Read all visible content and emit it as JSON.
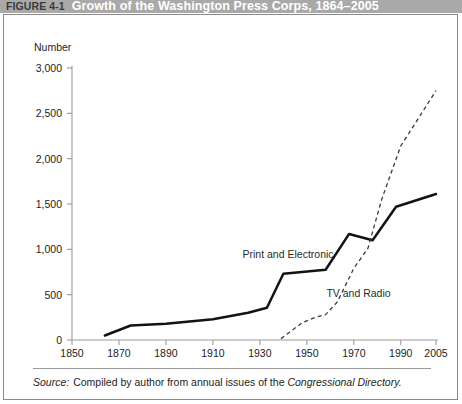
{
  "header": {
    "figure_number": "FIGURE 4-1",
    "title": "Growth of the Washington Press Corps, 1864–2005",
    "band_color": "#a9a9a9",
    "title_color": "#ffffff",
    "number_color": "#3b3b3b"
  },
  "source": {
    "label": "Source:",
    "text": "Compiled by author from annual issues of the",
    "italic_text": "Congressional Directory."
  },
  "chart_data": {
    "type": "line",
    "title": "Growth of the Washington Press Corps, 1864–2005",
    "xlabel": "",
    "ylabel": "Number",
    "xlim": [
      1850,
      2005
    ],
    "ylim": [
      0,
      3000
    ],
    "grid": false,
    "legend_position": "inline-annotation",
    "xticks": [
      1850,
      1870,
      1890,
      1910,
      1930,
      1950,
      1970,
      1990,
      2005
    ],
    "xticklabels": [
      "1850",
      "1870",
      "1890",
      "1910",
      "1930",
      "1950",
      "1970",
      "1990",
      "2005"
    ],
    "yticks": [
      0,
      500,
      1000,
      1500,
      2000,
      2500,
      3000
    ],
    "yticklabels": [
      "0",
      "500",
      "1,000",
      "1,500",
      "2,000",
      "2,500",
      "3,000"
    ],
    "series": [
      {
        "name": "Print and Electronic",
        "style": "solid",
        "color": "#131313",
        "label_x": 1942,
        "label_y": 900,
        "points": [
          [
            1864,
            50
          ],
          [
            1875,
            160
          ],
          [
            1890,
            180
          ],
          [
            1910,
            230
          ],
          [
            1925,
            300
          ],
          [
            1933,
            355
          ],
          [
            1940,
            730
          ],
          [
            1958,
            775
          ],
          [
            1968,
            1170
          ],
          [
            1978,
            1100
          ],
          [
            1988,
            1470
          ],
          [
            2005,
            1610
          ]
        ]
      },
      {
        "name": "TV and Radio",
        "style": "dashed",
        "color": "#3a3a3a",
        "label_x": 1972,
        "label_y": 470,
        "points": [
          [
            1939,
            15
          ],
          [
            1948,
            190
          ],
          [
            1953,
            245
          ],
          [
            1958,
            280
          ],
          [
            1963,
            420
          ],
          [
            1970,
            790
          ],
          [
            1976,
            1010
          ],
          [
            1982,
            1560
          ],
          [
            1990,
            2140
          ],
          [
            2005,
            2750
          ]
        ]
      }
    ]
  }
}
